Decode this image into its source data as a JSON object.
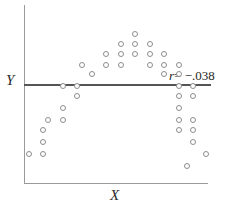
{
  "figure": {
    "axis_y_label": "Y",
    "axis_x_label": "X",
    "annotation_symbol": "r",
    "annotation_value": "= −.038",
    "annotation_full": "r = −.038"
  },
  "colors": {
    "axis": "#9a9a9a",
    "reference_line": "#555555",
    "marker_stroke": "#8d8d8d",
    "marker_fill": "#ffffff",
    "text": "#1f1f1f",
    "background": "#ffffff"
  },
  "chart_data": {
    "type": "scatter",
    "title": "",
    "xlabel": "X",
    "ylabel": "Y",
    "grid": false,
    "legend": false,
    "axis_ticks": false,
    "xlim": [
      0,
      100
    ],
    "ylim": [
      0,
      100
    ],
    "annotations": [
      {
        "text": "r = −.038",
        "symbol": "r",
        "value": -0.038,
        "x": 81,
        "y": 56
      }
    ],
    "reference_lines": [
      {
        "orientation": "horizontal",
        "label": "Y",
        "y": 55,
        "note": "mean of Y"
      }
    ],
    "points": [
      {
        "x": 60.3,
        "y": 90.5
      },
      {
        "x": 52.1,
        "y": 83.8
      },
      {
        "x": 60.3,
        "y": 83.8
      },
      {
        "x": 68.4,
        "y": 83.8
      },
      {
        "x": 44.0,
        "y": 77.1
      },
      {
        "x": 52.1,
        "y": 77.1
      },
      {
        "x": 60.3,
        "y": 77.1
      },
      {
        "x": 68.4,
        "y": 77.1
      },
      {
        "x": 76.5,
        "y": 77.1
      },
      {
        "x": 30.4,
        "y": 70.4
      },
      {
        "x": 44.0,
        "y": 70.4
      },
      {
        "x": 52.1,
        "y": 70.4
      },
      {
        "x": 68.4,
        "y": 70.4
      },
      {
        "x": 76.5,
        "y": 70.4
      },
      {
        "x": 84.7,
        "y": 70.4
      },
      {
        "x": 35.9,
        "y": 64.2
      },
      {
        "x": 76.5,
        "y": 64.2
      },
      {
        "x": 84.7,
        "y": 64.2
      },
      {
        "x": 19.6,
        "y": 56.4
      },
      {
        "x": 27.7,
        "y": 56.4
      },
      {
        "x": 84.7,
        "y": 56.4
      },
      {
        "x": 92.9,
        "y": 56.4
      },
      {
        "x": 27.7,
        "y": 50.3
      },
      {
        "x": 84.7,
        "y": 50.3
      },
      {
        "x": 92.9,
        "y": 50.3
      },
      {
        "x": 19.6,
        "y": 42.5
      },
      {
        "x": 84.7,
        "y": 42.5
      },
      {
        "x": 11.4,
        "y": 34.6
      },
      {
        "x": 19.6,
        "y": 34.6
      },
      {
        "x": 84.7,
        "y": 34.6
      },
      {
        "x": 92.9,
        "y": 34.6
      },
      {
        "x": 8.7,
        "y": 27.9
      },
      {
        "x": 84.7,
        "y": 27.9
      },
      {
        "x": 92.9,
        "y": 27.9
      },
      {
        "x": 8.7,
        "y": 20.1
      },
      {
        "x": 92.9,
        "y": 20.1
      },
      {
        "x": 0.5,
        "y": 12.3
      },
      {
        "x": 8.7,
        "y": 12.3
      },
      {
        "x": 100.0,
        "y": 12.3
      },
      {
        "x": 89.1,
        "y": 4.5
      }
    ]
  }
}
